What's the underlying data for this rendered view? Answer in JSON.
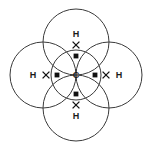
{
  "figure": {
    "molecule_formula": "CH4",
    "background_color": "#ffffff",
    "line_color": "#3a3a3a",
    "electron_color": "#111111",
    "width": 154,
    "height": 153
  },
  "central_atom": {
    "symbol": "C",
    "name": "carbon",
    "cx": 76,
    "cy": 75,
    "shell_radius": 25,
    "electron_marker": "dot"
  },
  "outer_atoms": [
    {
      "symbol": "H",
      "name": "hydrogen-top",
      "position": "top",
      "cx": 76,
      "cy": 42,
      "shell_radius": 33,
      "label_x": 76,
      "label_y": 34,
      "electron_marker": "cross"
    },
    {
      "symbol": "H",
      "name": "hydrogen-right",
      "position": "right",
      "cx": 109,
      "cy": 75,
      "shell_radius": 33,
      "label_x": 119,
      "label_y": 75,
      "electron_marker": "cross"
    },
    {
      "symbol": "H",
      "name": "hydrogen-bottom",
      "position": "bottom",
      "cx": 76,
      "cy": 108,
      "shell_radius": 33,
      "label_x": 76,
      "label_y": 116,
      "electron_marker": "cross"
    },
    {
      "symbol": "H",
      "name": "hydrogen-left",
      "position": "left",
      "cx": 43,
      "cy": 75,
      "shell_radius": 33,
      "label_x": 33,
      "label_y": 75,
      "electron_marker": "cross"
    }
  ],
  "bonds": [
    {
      "name": "bond-c-h-top",
      "between": "C-H",
      "type": "single covalent",
      "dot": {
        "x": 76,
        "y": 56
      },
      "cross": {
        "x": 76,
        "y": 45
      }
    },
    {
      "name": "bond-c-h-right",
      "between": "C-H",
      "type": "single covalent",
      "dot": {
        "x": 95,
        "y": 75
      },
      "cross": {
        "x": 106,
        "y": 75
      }
    },
    {
      "name": "bond-c-h-bottom",
      "between": "C-H",
      "type": "single covalent",
      "dot": {
        "x": 76,
        "y": 94
      },
      "cross": {
        "x": 76,
        "y": 105
      }
    },
    {
      "name": "bond-c-h-left",
      "between": "C-H",
      "type": "single covalent",
      "dot": {
        "x": 57,
        "y": 75
      },
      "cross": {
        "x": 46,
        "y": 75
      }
    }
  ],
  "legend": {
    "dot_meaning": "carbon electron",
    "cross_meaning": "hydrogen electron"
  }
}
